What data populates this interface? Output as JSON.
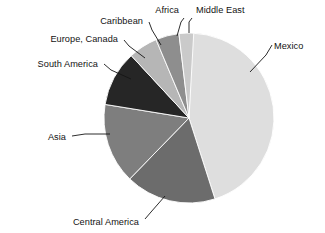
{
  "chart_data": {
    "type": "pie",
    "title": "",
    "subtitle": "",
    "xlabel": "",
    "ylabel": "",
    "legend_position": "callout-labels",
    "grid": false,
    "start_angle_deg": 0,
    "direction": "clockwise",
    "categories": [
      "Middle East",
      "Mexico",
      "Central America",
      "Asia",
      "South America",
      "Europe, Canada",
      "Caribbean",
      "Africa"
    ],
    "values": [
      0.6,
      44.4,
      17.2,
      15.3,
      10.6,
      5.6,
      4.4,
      1.9
    ],
    "value_unit": "percent",
    "slices": [
      {
        "label": "Middle East",
        "value": 0.6,
        "angle_deg": 2.2,
        "color": "#0b0b0b",
        "label_x": 196,
        "label_y": 13,
        "label_anchor": "start",
        "leader_points": "189,33 189,22 192,18"
      },
      {
        "label": "Mexico",
        "value": 44.4,
        "angle_deg": 160.0,
        "color": "#dedede",
        "label_x": 274,
        "label_y": 49,
        "label_anchor": "start",
        "leader_points": "250,72 266,55 272,45"
      },
      {
        "label": "Central America",
        "value": 17.2,
        "angle_deg": 62.0,
        "color": "#6c6c6c",
        "label_x": 139,
        "label_y": 225,
        "label_anchor": "end",
        "leader_points": "165,196 151,212 145,219"
      },
      {
        "label": "Asia",
        "value": 15.3,
        "angle_deg": 55.0,
        "color": "#7e7e7e",
        "label_x": 66,
        "label_y": 140,
        "label_anchor": "end",
        "leader_points": "110,134 85,134 72,136"
      },
      {
        "label": "South America",
        "value": 10.6,
        "angle_deg": 38.0,
        "color": "#262626",
        "label_x": 98,
        "label_y": 67,
        "label_anchor": "end",
        "leader_points": "131,79 111,70 104,64"
      },
      {
        "label": "Europe, Canada",
        "value": 5.6,
        "angle_deg": 20.0,
        "color": "#b6b6b6",
        "label_x": 118,
        "label_y": 42,
        "label_anchor": "end",
        "leader_points": "145,58 129,46 124,40"
      },
      {
        "label": "Caribbean",
        "value": 4.4,
        "angle_deg": 16.0,
        "color": "#8e8e8e",
        "label_x": 143,
        "label_y": 24,
        "label_anchor": "end",
        "leader_points": "161,45 152,30 149,22"
      },
      {
        "label": "Africa",
        "value": 1.9,
        "angle_deg": 10.0,
        "color": "#cacaca",
        "label_x": 179,
        "label_y": 13,
        "label_anchor": "end",
        "leader_points": "177,36 181,22 184,18"
      }
    ],
    "geometry": {
      "center_x": 189,
      "center_y": 118,
      "radius": 85
    },
    "colors": {
      "background": "#ffffff",
      "slice_border": "#ffffff",
      "label_text": "#131313",
      "leader_line": "#151515"
    }
  }
}
